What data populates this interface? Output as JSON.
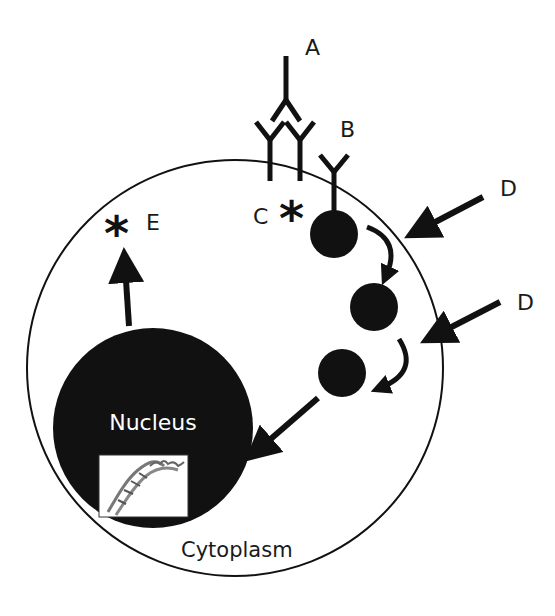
{
  "diagram": {
    "labels": {
      "A": "A",
      "B": "B",
      "C": "C",
      "D1": "D",
      "D2": "D",
      "E": "E",
      "nucleus": "Nucleus",
      "cytoplasm": "Cytoplasm"
    },
    "symbols": {
      "star": "*"
    },
    "colors": {
      "ink": "#111111",
      "background": "#ffffff",
      "nucleus_text": "#ffffff"
    },
    "icons": {
      "dna": "dna-helix-icon"
    }
  }
}
